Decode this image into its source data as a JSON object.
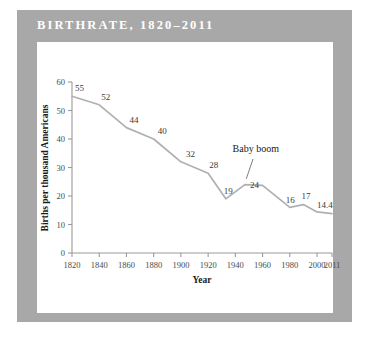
{
  "header": {
    "title": "BIRTHRATE, 1820–2011",
    "bar_color": "#a8a8a8",
    "title_color": "#ffffff"
  },
  "card": {
    "background": "#ffffff"
  },
  "chart_data": {
    "type": "line",
    "title": "BIRTHRATE, 1820–2011",
    "xlabel": "Year",
    "ylabel": "Births per thousand Americans",
    "xlim": [
      1820,
      2011
    ],
    "ylim": [
      0,
      60
    ],
    "grid": false,
    "legend": null,
    "line_color": "#b0b0b0",
    "axis_color": "#9a9a9a",
    "xticks": [
      1820,
      1840,
      1860,
      1880,
      1900,
      1920,
      1940,
      1960,
      1980,
      2000,
      2011
    ],
    "xticklabels": [
      "1820",
      "1840",
      "1860",
      "1880",
      "1900",
      "1920",
      "1940",
      "1960",
      "1980",
      "2000",
      "2011"
    ],
    "yticks": [
      0,
      10,
      20,
      30,
      40,
      50,
      60
    ],
    "yticklabels": [
      "0",
      "10",
      "20",
      "30",
      "40",
      "50",
      "60"
    ],
    "x": [
      1820,
      1840,
      1860,
      1880,
      1900,
      1920,
      1933,
      1947,
      1960,
      1980,
      1990,
      2000,
      2011
    ],
    "y": [
      55,
      52,
      44,
      40,
      32,
      28,
      19,
      24,
      23.7,
      16,
      17,
      14.4,
      13.8
    ],
    "point_labels": [
      {
        "text": "55",
        "x": 1820,
        "y": 55,
        "dx": 3,
        "dy": -5
      },
      {
        "text": "52",
        "x": 1840,
        "y": 52,
        "dx": 2,
        "dy": -5
      },
      {
        "text": "44",
        "x": 1860,
        "y": 44,
        "dx": 3,
        "dy": -5
      },
      {
        "text": "40",
        "x": 1880,
        "y": 40,
        "dx": 4,
        "dy": -5
      },
      {
        "text": "32",
        "x": 1900,
        "y": 32,
        "dx": 5,
        "dy": -5
      },
      {
        "text": "28",
        "x": 1920,
        "y": 28,
        "dx": 1,
        "dy": -5
      },
      {
        "text": "19",
        "x": 1933,
        "y": 19,
        "dx": -2,
        "dy": -5
      },
      {
        "text": "24",
        "x": 1947,
        "y": 24,
        "dx": 5,
        "dy": 3
      },
      {
        "text": "16",
        "x": 1980,
        "y": 16,
        "dx": -4,
        "dy": -4
      },
      {
        "text": "17",
        "x": 1990,
        "y": 17,
        "dx": -2,
        "dy": -6
      },
      {
        "text": "14.4",
        "x": 2000,
        "y": 14.4,
        "dx": 0,
        "dy": -4
      }
    ],
    "annotations": [
      {
        "text": "Baby boom",
        "label_x": 1955,
        "label_y": 35.5,
        "leader_from_x": 1953,
        "leader_from_y": 33,
        "leader_to_x": 1948,
        "leader_to_y": 26
      }
    ]
  }
}
